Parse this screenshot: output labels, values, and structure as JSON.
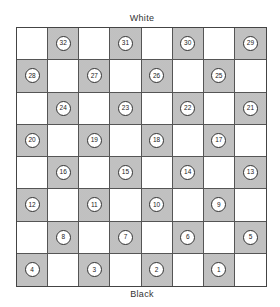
{
  "labels": {
    "top": "White",
    "bottom": "Black"
  },
  "colors": {
    "light_square": "#ffffff",
    "dark_square": "#cbcbcb",
    "grid_line": "#555555"
  },
  "board": {
    "size": 8,
    "rows": [
      [
        null,
        32,
        null,
        31,
        null,
        30,
        null,
        29
      ],
      [
        28,
        null,
        27,
        null,
        26,
        null,
        25,
        null
      ],
      [
        null,
        24,
        null,
        23,
        null,
        22,
        null,
        21
      ],
      [
        20,
        null,
        19,
        null,
        18,
        null,
        17,
        null
      ],
      [
        null,
        16,
        null,
        15,
        null,
        14,
        null,
        13
      ],
      [
        12,
        null,
        11,
        null,
        10,
        null,
        9,
        null
      ],
      [
        null,
        8,
        null,
        7,
        null,
        6,
        null,
        5
      ],
      [
        4,
        null,
        3,
        null,
        2,
        null,
        1,
        null
      ]
    ]
  }
}
